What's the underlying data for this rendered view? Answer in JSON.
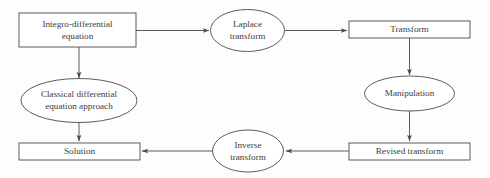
{
  "diagram": {
    "background_color": "#fdfdfd",
    "stroke_color": "#4a4a4a",
    "text_color": "#3b3b3b",
    "nodes": [
      {
        "id": "integro-differential-equation",
        "shape": "rectangle",
        "line1": "Integro-differential",
        "line2": "equation"
      },
      {
        "id": "laplace-transform",
        "shape": "ellipse",
        "line1": "Laplace",
        "line2": "transform"
      },
      {
        "id": "transform",
        "shape": "rectangle",
        "line1": "Transform",
        "line2": ""
      },
      {
        "id": "classical-differential-equation-approach",
        "shape": "ellipse",
        "line1": "Classical differential",
        "line2": "equation approach"
      },
      {
        "id": "manipulation",
        "shape": "ellipse",
        "line1": "Manipulation",
        "line2": ""
      },
      {
        "id": "solution",
        "shape": "rectangle",
        "line1": "Solution",
        "line2": ""
      },
      {
        "id": "inverse-transform",
        "shape": "ellipse",
        "line1": "Inverse",
        "line2": "transform"
      },
      {
        "id": "revised-transform",
        "shape": "rectangle",
        "line1": "Revised transform",
        "line2": ""
      }
    ],
    "edges": [
      {
        "id": "edge-equation-to-laplace",
        "from": "integro-differential-equation",
        "to": "laplace-transform",
        "direction": "right"
      },
      {
        "id": "edge-laplace-to-transform",
        "from": "laplace-transform",
        "to": "transform",
        "direction": "right"
      },
      {
        "id": "edge-transform-to-manipulation",
        "from": "transform",
        "to": "manipulation",
        "direction": "down"
      },
      {
        "id": "edge-manipulation-to-revised",
        "from": "manipulation",
        "to": "revised-transform",
        "direction": "down"
      },
      {
        "id": "edge-revised-to-inverse",
        "from": "revised-transform",
        "to": "inverse-transform",
        "direction": "left"
      },
      {
        "id": "edge-inverse-to-solution",
        "from": "inverse-transform",
        "to": "solution",
        "direction": "left"
      },
      {
        "id": "edge-equation-to-classical",
        "from": "integro-differential-equation",
        "to": "classical-differential-equation-approach",
        "direction": "down"
      },
      {
        "id": "edge-classical-to-solution",
        "from": "classical-differential-equation-approach",
        "to": "solution",
        "direction": "down"
      }
    ]
  }
}
